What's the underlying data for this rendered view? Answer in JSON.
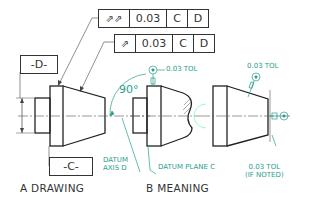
{
  "fcf_total_runout": {
    "symbol": "total-runout",
    "symbol_glyph": "⌰⌰",
    "tolerance": "0.03",
    "datum_1": "C",
    "datum_2": "D"
  },
  "fcf_circular_runout": {
    "symbol": "circular-runout",
    "symbol_glyph": "↗",
    "tolerance": "0.03",
    "datum_1": "C",
    "datum_2": "D"
  },
  "datum_d_label": "-D-",
  "datum_c_label": "-C-",
  "meaning": {
    "angle": "90°",
    "tol_top_left": "0.03 TOL",
    "tol_top_right": "0.03 TOL",
    "datum_axis_line1": "DATUM",
    "datum_axis_line2": "AXIS D",
    "datum_plane": "DATUM PLANE C",
    "tol_bottom_line1": "0.03 TOL",
    "tol_bottom_line2": "(IF NOTED)"
  },
  "captions": {
    "a": "A DRAWING",
    "b": "B MEANING"
  },
  "colors": {
    "line": "#333333",
    "annotation": "#2a9d8f"
  }
}
